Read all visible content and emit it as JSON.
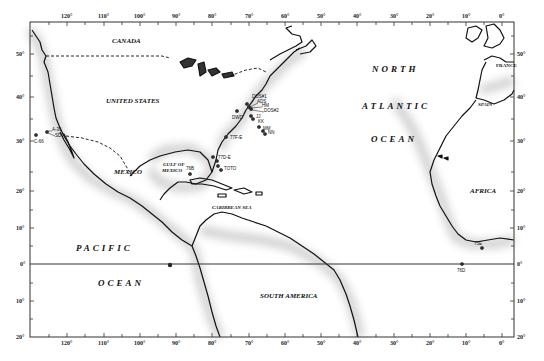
{
  "map": {
    "frame": {
      "left": 30,
      "top": 22,
      "right": 514,
      "bottom": 337
    },
    "equator_y": 264,
    "colors": {
      "land_outline": "#111111",
      "coast_shade": "#9a9a9a",
      "background": "#ffffff",
      "frame": "#333333"
    },
    "top_ticks": [
      {
        "label": "120°",
        "x": 67
      },
      {
        "label": "110°",
        "x": 104
      },
      {
        "label": "100°",
        "x": 140
      },
      {
        "label": "90°",
        "x": 176
      },
      {
        "label": "80°",
        "x": 212
      },
      {
        "label": "70°",
        "x": 249
      },
      {
        "label": "60°",
        "x": 285
      },
      {
        "label": "50°",
        "x": 321
      },
      {
        "label": "40°",
        "x": 357
      },
      {
        "label": "30°",
        "x": 394
      },
      {
        "label": "20°",
        "x": 430
      },
      {
        "label": "10°",
        "x": 466
      },
      {
        "label": "0°",
        "x": 502
      }
    ],
    "left_ticks": [
      {
        "label": "50°",
        "y": 54
      },
      {
        "label": "40°",
        "y": 97
      },
      {
        "label": "30°",
        "y": 141
      },
      {
        "label": "20°",
        "y": 191
      },
      {
        "label": "10°",
        "y": 228
      },
      {
        "label": "0°",
        "y": 264
      },
      {
        "label": "10°",
        "y": 301
      },
      {
        "label": "20°",
        "y": 337
      }
    ],
    "region_labels": {
      "canada": "CANADA",
      "united_states": "UNITED STATES",
      "mexico": "MEXICO",
      "gulf_of_mexico_1": "GULF OF",
      "gulf_of_mexico_2": "MEXICO",
      "caribbean_sea": "CARIBBEAN SEA",
      "south_america": "SOUTH AMERICA",
      "north": "NORTH",
      "atlantic": "ATLANTIC",
      "ocean_atl": "OCEAN",
      "pacific": "PACIFIC",
      "ocean_pac": "OCEAN",
      "africa": "AFRICA",
      "france": "FRANCE",
      "spain": "SPAIN"
    },
    "stations": [
      {
        "id": "A-36",
        "x": 52,
        "y": 129
      },
      {
        "id": "SDT",
        "x": 55,
        "y": 134
      },
      {
        "id": "C-66",
        "x": 35,
        "y": 140
      },
      {
        "id": "DOS#1",
        "x": 252,
        "y": 96
      },
      {
        "id": "ADS",
        "x": 257,
        "y": 101
      },
      {
        "id": "HM",
        "x": 262,
        "y": 105
      },
      {
        "id": "DOS#2",
        "x": 264,
        "y": 110
      },
      {
        "id": "DWD",
        "x": 232,
        "y": 117
      },
      {
        "id": "JJ",
        "x": 256,
        "y": 116
      },
      {
        "id": "KK",
        "x": 258,
        "y": 121
      },
      {
        "id": "MM",
        "x": 263,
        "y": 128
      },
      {
        "id": "NN",
        "x": 268,
        "y": 132
      },
      {
        "id": "77F-E",
        "x": 230,
        "y": 137
      },
      {
        "id": "77D-E",
        "x": 218,
        "y": 157
      },
      {
        "id": "TOTO",
        "x": 224,
        "y": 168
      },
      {
        "id": "76B",
        "x": 188,
        "y": 168
      },
      {
        "id": "75E",
        "x": 474,
        "y": 243
      },
      {
        "id": "76D",
        "x": 459,
        "y": 270
      }
    ]
  }
}
